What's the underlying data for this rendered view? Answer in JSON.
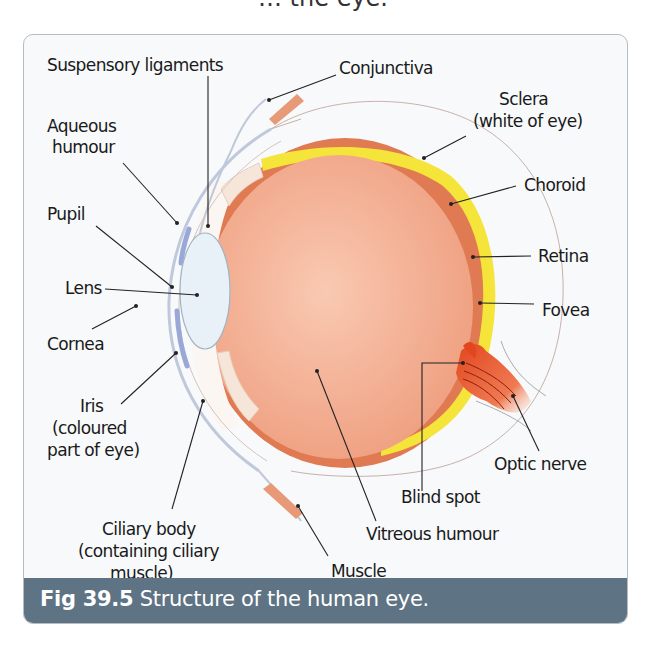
{
  "title_fragment": "… the eye.",
  "figure": {
    "number": "Fig 39.5",
    "caption": " Structure of the human eye."
  },
  "labels": {
    "suspensory_ligaments": "Suspensory ligaments",
    "conjunctiva": "Conjunctiva",
    "sclera_1": "Sclera",
    "sclera_2": "(white of eye)",
    "aqueous_1": "Aqueous",
    "aqueous_2": "humour",
    "choroid": "Choroid",
    "pupil": "Pupil",
    "retina": "Retina",
    "lens": "Lens",
    "fovea": "Fovea",
    "cornea": "Cornea",
    "iris_1": "Iris",
    "iris_2": "(coloured",
    "iris_3": "part of eye)",
    "optic_nerve": "Optic nerve",
    "blind_spot": "Blind spot",
    "ciliary_1": "Ciliary body",
    "ciliary_2": "(containing ciliary",
    "ciliary_3": "muscle)",
    "vitreous": "Vitreous humour",
    "muscle": "Muscle"
  },
  "colors": {
    "caption_bar": "#5e7384",
    "choroid": "#e07a52",
    "retina": "#f5e53a",
    "vitreous": "#f2ad90",
    "lens": "#e8f1f8",
    "iris": "#9aa8d8",
    "optic_nerve": "#e5532a"
  }
}
